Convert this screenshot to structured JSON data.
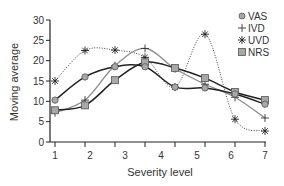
{
  "chart_data": {
    "type": "line",
    "title": "",
    "xlabel": "Severity level",
    "ylabel": "Moving average",
    "x_tick_labels": [
      "1",
      "2",
      "3",
      "4",
      "5",
      "6",
      "7"
    ],
    "x_points": [
      1,
      2,
      3,
      4,
      5,
      6,
      7,
      8
    ],
    "y_ticks": [
      0,
      5,
      10,
      15,
      20,
      25,
      30
    ],
    "ylim": [
      0,
      30
    ],
    "grid": false,
    "legend_position": "top-right",
    "series": [
      {
        "name": "VAS",
        "marker": "circle",
        "line": "solid-dark",
        "values": [
          10.3,
          16.0,
          18.5,
          18.5,
          13.5,
          13.3,
          11.8,
          9.3
        ]
      },
      {
        "name": "IVD",
        "marker": "plus",
        "line": "solid-gray",
        "values": [
          7.2,
          10.3,
          18.8,
          23.0,
          18.0,
          14.2,
          11.0,
          5.9
        ]
      },
      {
        "name": "UVD",
        "marker": "asterisk",
        "line": "dotted",
        "values": [
          15.0,
          22.5,
          22.6,
          20.8,
          13.5,
          26.5,
          5.6,
          2.7
        ]
      },
      {
        "name": "NRS",
        "marker": "square",
        "line": "solid-dark",
        "values": [
          7.8,
          9.0,
          15.2,
          19.6,
          18.2,
          15.7,
          12.3,
          10.3
        ]
      }
    ]
  },
  "legend": {
    "items": [
      {
        "label": "VAS"
      },
      {
        "label": "IVD"
      },
      {
        "label": "UVD"
      },
      {
        "label": "NRS"
      }
    ]
  },
  "axes": {
    "xlabel": "Severity level",
    "ylabel": "Moving average",
    "y_labels": [
      "0",
      "5",
      "10",
      "15",
      "20",
      "25",
      "30"
    ],
    "x_labels": [
      "1",
      "2",
      "3",
      "4",
      "5",
      "6",
      "7"
    ]
  },
  "colors": {
    "dark_line": "#222222",
    "gray_line": "#8a8a8a",
    "marker_fill": "#a8a8a8",
    "marker_stroke": "#555555"
  }
}
